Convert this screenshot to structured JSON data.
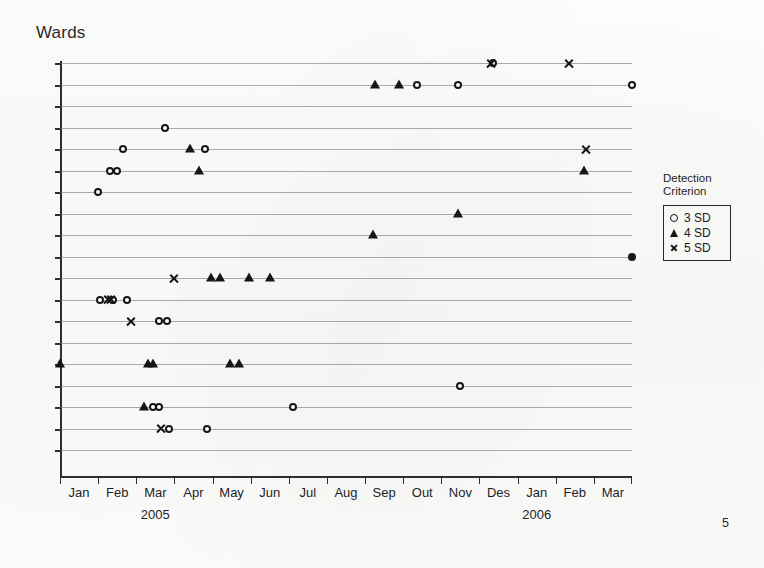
{
  "slide": {
    "title": "Wards",
    "page_number": "5"
  },
  "legend": {
    "title": "Detection\nCriterion",
    "items": [
      {
        "symbol": "circle",
        "label": "3 SD"
      },
      {
        "symbol": "triangle",
        "label": "4 SD"
      },
      {
        "symbol": "cross",
        "label": "5 SD"
      }
    ]
  },
  "chart_data": {
    "type": "scatter",
    "title": "Wards",
    "xlabel": "",
    "ylabel": "",
    "grid": true,
    "legend_position": "right",
    "legend_title": "Detection Criterion",
    "x_tick_labels": [
      "Jan",
      "Feb",
      "Mar",
      "Apr",
      "May",
      "Jun",
      "Jul",
      "Aug",
      "Sep",
      "Out",
      "Nov",
      "Des",
      "Jan",
      "Feb",
      "Mar"
    ],
    "x_group_labels": [
      {
        "label": "2005",
        "span": [
          "Jan",
          "Des"
        ],
        "center_month_index": 2
      },
      {
        "label": "2006",
        "span": [
          "Jan",
          "Mar"
        ],
        "center_month_index": 12
      }
    ],
    "x_axis_range_months": [
      0,
      15
    ],
    "y_axis_label_visible": false,
    "y_categories_count": 19,
    "y_note": "Each horizontal gridline is one hospital ward (unlabeled categorical axis)",
    "series": [
      {
        "name": "3 SD",
        "symbol": "circle",
        "points": [
          {
            "x_month": 11.35,
            "ward": 1
          },
          {
            "x_month": 10.45,
            "ward": 2
          },
          {
            "x_month": 15.0,
            "ward": 2
          },
          {
            "x_month": 9.35,
            "ward": 2
          },
          {
            "x_month": 2.75,
            "ward": 4
          },
          {
            "x_month": 1.65,
            "ward": 5
          },
          {
            "x_month": 3.8,
            "ward": 5
          },
          {
            "x_month": 1.3,
            "ward": 6
          },
          {
            "x_month": 1.5,
            "ward": 6
          },
          {
            "x_month": 1.0,
            "ward": 7
          },
          {
            "x_month": 1.05,
            "ward": 12
          },
          {
            "x_month": 1.4,
            "ward": 12
          },
          {
            "x_month": 1.75,
            "ward": 12
          },
          {
            "x_month": 2.6,
            "ward": 13
          },
          {
            "x_month": 2.8,
            "ward": 13
          },
          {
            "x_month": 10.5,
            "ward": 16
          },
          {
            "x_month": 2.45,
            "ward": 17
          },
          {
            "x_month": 2.6,
            "ward": 17
          },
          {
            "x_month": 6.1,
            "ward": 17
          },
          {
            "x_month": 2.85,
            "ward": 18
          },
          {
            "x_month": 3.85,
            "ward": 18
          }
        ]
      },
      {
        "name": "4 SD",
        "symbol": "triangle",
        "points": [
          {
            "x_month": 8.25,
            "ward": 2
          },
          {
            "x_month": 8.9,
            "ward": 2
          },
          {
            "x_month": 3.4,
            "ward": 5
          },
          {
            "x_month": 3.65,
            "ward": 6
          },
          {
            "x_month": 13.75,
            "ward": 6
          },
          {
            "x_month": 10.45,
            "ward": 8
          },
          {
            "x_month": 8.2,
            "ward": 9
          },
          {
            "x_month": 3.95,
            "ward": 11
          },
          {
            "x_month": 4.2,
            "ward": 11
          },
          {
            "x_month": 4.95,
            "ward": 11
          },
          {
            "x_month": 5.5,
            "ward": 11
          },
          {
            "x_month": 0.0,
            "ward": 15
          },
          {
            "x_month": 2.3,
            "ward": 15
          },
          {
            "x_month": 2.45,
            "ward": 15
          },
          {
            "x_month": 4.45,
            "ward": 15
          },
          {
            "x_month": 4.7,
            "ward": 15
          },
          {
            "x_month": 2.2,
            "ward": 17
          }
        ]
      },
      {
        "name": "5 SD",
        "symbol": "cross",
        "points": [
          {
            "x_month": 11.3,
            "ward": 1
          },
          {
            "x_month": 13.35,
            "ward": 1
          },
          {
            "x_month": 13.8,
            "ward": 5
          },
          {
            "x_month": 3.0,
            "ward": 11
          },
          {
            "x_month": 1.25,
            "ward": 12
          },
          {
            "x_month": 1.35,
            "ward": 12
          },
          {
            "x_month": 1.85,
            "ward": 13
          },
          {
            "x_month": 2.65,
            "ward": 18
          }
        ]
      },
      {
        "name": "overlapping-filled",
        "symbol": "circle-filled",
        "points": [
          {
            "x_month": 15.0,
            "ward": 10
          }
        ]
      }
    ]
  }
}
